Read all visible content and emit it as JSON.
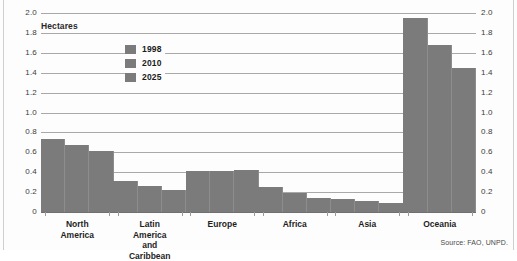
{
  "units_label": "Hectares",
  "source": "Source: FAO, UNPD.",
  "legend": {
    "position": "inside-upper-left",
    "items": [
      {
        "label": "1998",
        "color": "#7b7b7b"
      },
      {
        "label": "2010",
        "color": "#7b7b7b"
      },
      {
        "label": "2025",
        "color": "#7b7b7b"
      }
    ]
  },
  "axis": {
    "ticks": [
      "2.0",
      "1.8",
      "1.6",
      "1.4",
      "1.2",
      "1.0",
      "0.8",
      "0.6",
      "0.4",
      "0.2",
      "0"
    ]
  },
  "chart_data": {
    "type": "bar",
    "title": "",
    "subtitle": "",
    "xlabel": "",
    "ylabel": "Hectares",
    "ylim": [
      0,
      2.0
    ],
    "ytick_step": 0.2,
    "grid": true,
    "legend_position": "inside-upper-left",
    "categories": [
      "North\nAmerica",
      "Latin America\nand Caribbean",
      "Europe",
      "Africa",
      "Asia",
      "Oceania"
    ],
    "series": [
      {
        "name": "1998",
        "color": "#7b7b7b",
        "values": [
          0.73,
          0.31,
          0.41,
          0.25,
          0.13,
          1.95
        ]
      },
      {
        "name": "2010",
        "color": "#7b7b7b",
        "values": [
          0.67,
          0.26,
          0.41,
          0.19,
          0.11,
          1.68
        ]
      },
      {
        "name": "2025",
        "color": "#7b7b7b",
        "values": [
          0.61,
          0.22,
          0.42,
          0.14,
          0.09,
          1.45
        ]
      }
    ],
    "annotations": [
      "Source: FAO, UNPD."
    ]
  }
}
